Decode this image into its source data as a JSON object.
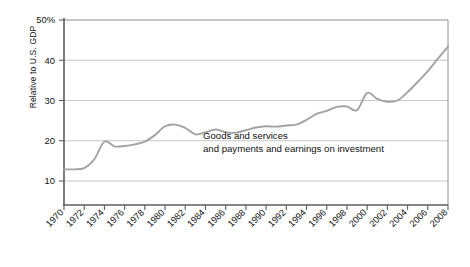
{
  "chart_data": {
    "type": "line",
    "title": "",
    "subtitle": "",
    "xlabel": "",
    "ylabel": "Relative to U.S. GDP",
    "xlim": [
      1970,
      2008
    ],
    "ylim": [
      0,
      50
    ],
    "yticks": [
      10,
      20,
      30,
      40,
      50
    ],
    "ytick_labels": [
      "10",
      "20",
      "30",
      "40",
      "50%"
    ],
    "xticks": [
      1970,
      1972,
      1974,
      1976,
      1978,
      1980,
      1982,
      1984,
      1986,
      1988,
      1990,
      1992,
      1994,
      1996,
      1998,
      2000,
      2002,
      2004,
      2006,
      2008
    ],
    "xtick_labels": [
      "1970",
      "1972",
      "1974",
      "1976",
      "1978",
      "1980",
      "1982",
      "1984",
      "1986",
      "1988",
      "1990",
      "1992",
      "1994",
      "1996",
      "1998",
      "2000",
      "2002",
      "2004",
      "2006",
      "2008"
    ],
    "grid": "horizontal",
    "legend": "none",
    "annotations": [
      {
        "name": "series-label-line-1",
        "text": "Goods and services"
      },
      {
        "name": "series-label-line-2",
        "text": "and payments and earnings on investment"
      }
    ],
    "series": [
      {
        "name": "Goods and services and payments and earnings on investment",
        "color": "#a3a3a3",
        "x": [
          1970,
          1971,
          1972,
          1973,
          1974,
          1975,
          1976,
          1977,
          1978,
          1979,
          1980,
          1981,
          1982,
          1983,
          1984,
          1985,
          1986,
          1987,
          1988,
          1989,
          1990,
          1991,
          1992,
          1993,
          1994,
          1995,
          1996,
          1997,
          1998,
          1999,
          2000,
          2001,
          2002,
          2003,
          2004,
          2005,
          2006,
          2007,
          2008
        ],
        "values": [
          12.9,
          12.9,
          13.2,
          15.4,
          19.8,
          18.6,
          18.7,
          19.1,
          19.8,
          21.4,
          23.6,
          24.0,
          23.2,
          21.6,
          22.1,
          22.8,
          22.1,
          22.0,
          22.6,
          23.3,
          23.6,
          23.5,
          23.8,
          24.0,
          25.2,
          26.7,
          27.4,
          28.4,
          28.5,
          27.6,
          31.9,
          30.4,
          29.7,
          30.0,
          32.1,
          34.6,
          37.3,
          40.4,
          43.4
        ]
      }
    ]
  }
}
